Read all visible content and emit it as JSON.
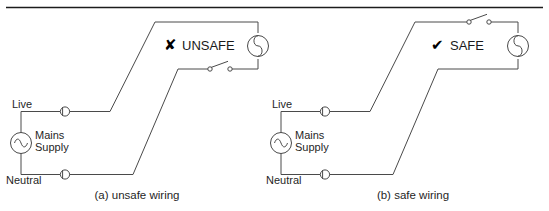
{
  "figure": {
    "background_color": "#ffffff",
    "line_color": "#4a4a4a",
    "rule_color": "#1c1c1c",
    "text_color": "#1f1f1f"
  },
  "diagrams": [
    {
      "id": "a",
      "caption": "(a) unsafe wiring",
      "verdict_label": "UNSAFE",
      "verdict_mark": "✘",
      "verdict_mark_name": "cross-mark-icon",
      "source_label_line1": "Mains",
      "source_label_line2": "Supply",
      "source_symbol": "ac-source-sine",
      "live_label": "Live",
      "neutral_label": "Neutral",
      "lamp_symbol": "lamp-circle-s",
      "switch_symbol": "open-switch",
      "switch_in_conductor": "Neutral"
    },
    {
      "id": "b",
      "caption": "(b) safe wiring",
      "verdict_label": "SAFE",
      "verdict_mark": "✔",
      "verdict_mark_name": "check-mark-icon",
      "source_label_line1": "Mains",
      "source_label_line2": "Supply",
      "source_symbol": "ac-source-sine",
      "live_label": "Live",
      "neutral_label": "Neutral",
      "lamp_symbol": "lamp-circle-s",
      "switch_symbol": "open-switch",
      "switch_in_conductor": "Live"
    }
  ]
}
